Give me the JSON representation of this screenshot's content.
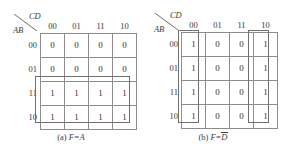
{
  "figure": {
    "background_color": "#ffffff",
    "grid_color": "#8c8c8c",
    "group_color": "#6f6f6f",
    "text_color": "#3a3a3a"
  },
  "maps": [
    {
      "id": "kmap-a",
      "corner": {
        "col_vars": "CD",
        "row_vars": "AB",
        "slash_icon": "diagonal-slash-icon"
      },
      "col_headers": [
        "00",
        "01",
        "11",
        "10"
      ],
      "row_headers": [
        "00",
        "01",
        "11",
        "10"
      ],
      "cells": [
        [
          "0",
          "0",
          "0",
          "0"
        ],
        [
          "0",
          "0",
          "0",
          "0"
        ],
        [
          "1",
          "1",
          "1",
          "1"
        ],
        [
          "1",
          "1",
          "1",
          "1"
        ]
      ],
      "groups": [
        {
          "label": "group-A-bottom-two-rows",
          "left": 35,
          "top": 76,
          "width": 95,
          "height": 47
        }
      ],
      "caption": {
        "tag": "(a)",
        "expr_lhs": "F=",
        "expr_var": "A",
        "overbar": false
      }
    },
    {
      "id": "kmap-b",
      "corner": {
        "col_vars": "CD",
        "row_vars": "AB",
        "slash_icon": "diagonal-slash-icon"
      },
      "col_headers": [
        "00",
        "01",
        "11",
        "10"
      ],
      "row_headers": [
        "00",
        "01",
        "11",
        "10"
      ],
      "cells": [
        [
          "1",
          "0",
          "0",
          "1"
        ],
        [
          "1",
          "0",
          "0",
          "1"
        ],
        [
          "1",
          "0",
          "0",
          "1"
        ],
        [
          "1",
          "0",
          "0",
          "1"
        ]
      ],
      "groups": [
        {
          "label": "group-D-bar-column-00",
          "left": 36,
          "top": 30,
          "width": 21,
          "height": 93
        },
        {
          "label": "group-D-bar-column-10",
          "left": 106,
          "top": 30,
          "width": 21,
          "height": 93
        }
      ],
      "caption": {
        "tag": "(b)",
        "expr_lhs": "F=",
        "expr_var": "D",
        "overbar": true
      }
    }
  ],
  "chart_data": {
    "type": "table",
    "panels": [
      {
        "name": "(a) F=A",
        "row_variables": "AB",
        "col_variables": "CD",
        "row_labels": [
          "00",
          "01",
          "11",
          "10"
        ],
        "col_labels": [
          "00",
          "01",
          "11",
          "10"
        ],
        "values": [
          [
            0,
            0,
            0,
            0
          ],
          [
            0,
            0,
            0,
            0
          ],
          [
            1,
            1,
            1,
            1
          ],
          [
            1,
            1,
            1,
            1
          ]
        ],
        "minterms_true": [
          8,
          9,
          10,
          11,
          12,
          13,
          14,
          15
        ],
        "groupings": [
          {
            "covers_rows": [
              "11",
              "10"
            ],
            "covers_cols": [
              "00",
              "01",
              "11",
              "10"
            ],
            "size": 8,
            "implicant": "A"
          }
        ],
        "result": "F=A"
      },
      {
        "name": "(b) F=D-bar",
        "row_variables": "AB",
        "col_variables": "CD",
        "row_labels": [
          "00",
          "01",
          "11",
          "10"
        ],
        "col_labels": [
          "00",
          "01",
          "11",
          "10"
        ],
        "values": [
          [
            1,
            0,
            0,
            1
          ],
          [
            1,
            0,
            0,
            1
          ],
          [
            1,
            0,
            0,
            1
          ],
          [
            1,
            0,
            0,
            1
          ]
        ],
        "minterms_true": [
          0,
          2,
          4,
          6,
          8,
          10,
          12,
          14
        ],
        "groupings": [
          {
            "covers_rows": [
              "00",
              "01",
              "11",
              "10"
            ],
            "covers_cols": [
              "00"
            ],
            "size": 4,
            "implicant": "C'D'"
          },
          {
            "covers_rows": [
              "00",
              "01",
              "11",
              "10"
            ],
            "covers_cols": [
              "10"
            ],
            "size": 4,
            "implicant": "CD'"
          }
        ],
        "result": "F=D-bar"
      }
    ]
  }
}
